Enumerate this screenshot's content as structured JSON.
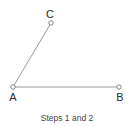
{
  "diagram": {
    "points": [
      {
        "id": "A",
        "label": "A",
        "x": 13,
        "y": 87,
        "label_x": 13,
        "label_y": 101
      },
      {
        "id": "B",
        "label": "B",
        "x": 119,
        "y": 87,
        "label_x": 120,
        "label_y": 101
      },
      {
        "id": "C",
        "label": "C",
        "x": 51,
        "y": 23,
        "label_x": 50,
        "label_y": 18
      }
    ],
    "segments": [
      {
        "from": "A",
        "to": "B"
      },
      {
        "from": "A",
        "to": "C"
      }
    ],
    "caption": "Steps 1 and 2",
    "colors": {
      "line": "#9a9a9a",
      "point": "#777777",
      "text": "#2a2a2a"
    }
  }
}
